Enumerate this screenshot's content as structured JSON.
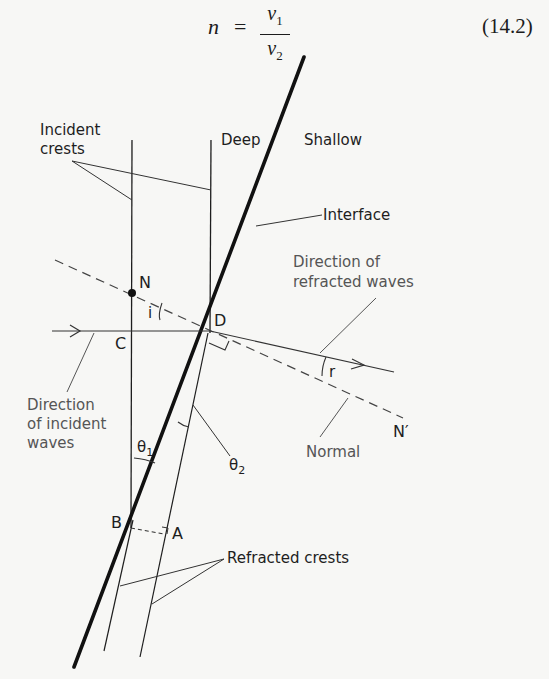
{
  "equation": {
    "lhs": "n",
    "equals": "=",
    "numerator": "v",
    "numerator_sub": "1",
    "denominator": "v",
    "denominator_sub": "2",
    "number": "(14.2)"
  },
  "diagram": {
    "labels": {
      "incident_crests_line1": "Incident",
      "incident_crests_line2": "crests",
      "deep": "Deep",
      "shallow": "Shallow",
      "interface": "Interface",
      "refracted_dir_line1": "Direction of",
      "refracted_dir_line2": "refracted waves",
      "incident_dir_line1": "Direction",
      "incident_dir_line2": "of incident",
      "incident_dir_line3": "waves",
      "normal": "Normal",
      "refracted_crests": "Refracted crests"
    },
    "points": {
      "N": "N",
      "N_prime": "N′",
      "C": "C",
      "D": "D",
      "B": "B",
      "A": "A"
    },
    "angles": {
      "i": "i",
      "r": "r",
      "theta1": "θ",
      "theta1_sub": "1",
      "theta2": "θ",
      "theta2_sub": "2"
    },
    "colors": {
      "ink": "#1e1e1e",
      "background": "#f7f7f5",
      "annotation_gray": "#555555"
    }
  }
}
